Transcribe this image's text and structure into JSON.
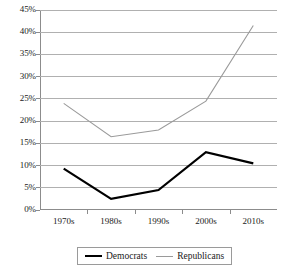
{
  "chart_data": {
    "type": "line",
    "title": "",
    "subtitle": "",
    "xlabel": "",
    "ylabel": "",
    "categories": [
      "1970s",
      "1980s",
      "1990s",
      "2000s",
      "2010s"
    ],
    "ylim": [
      0,
      45
    ],
    "ytick_step": 5,
    "ytick_labels": [
      "0%",
      "5%",
      "10%",
      "15%",
      "20%",
      "25%",
      "30%",
      "35%",
      "40%",
      "45%"
    ],
    "ytick_values": [
      0,
      5,
      10,
      15,
      20,
      25,
      30,
      35,
      40,
      45
    ],
    "grid": true,
    "legend_position": "bottom",
    "series": [
      {
        "name": "Democrats",
        "color": "#000000",
        "width": 2.2,
        "values": [
          9.3,
          2.5,
          4.5,
          13.0,
          10.5
        ]
      },
      {
        "name": "Republicans",
        "color": "#9a9a9a",
        "width": 1.1,
        "values": [
          24.0,
          16.5,
          18.0,
          24.5,
          41.5
        ]
      }
    ]
  },
  "axes": {
    "y_labels": [
      "45%",
      "40%",
      "35%",
      "30%",
      "25%",
      "20%",
      "15%",
      "10%",
      "5%",
      "0%"
    ],
    "x_labels": [
      "1970s",
      "1980s",
      "1990s",
      "2000s",
      "2010s"
    ]
  },
  "legend": {
    "items": [
      {
        "label": "Democrats",
        "swatch": "thick-black-line"
      },
      {
        "label": "Republicans",
        "swatch": "thin-gray-line"
      }
    ]
  },
  "colors": {
    "democrats": "#000000",
    "republicans": "#9a9a9a",
    "gridline": "#b0b0b0",
    "axis": "#8c8c8c",
    "background": "#ffffff"
  }
}
